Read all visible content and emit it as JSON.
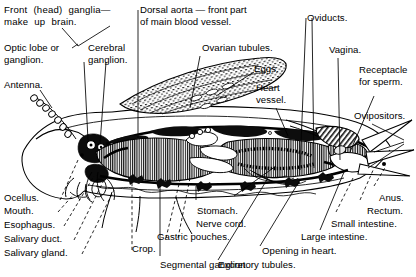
{
  "figure": {
    "orientation": "left-facing head, right-facing abdomen tip",
    "line_color": "#000000",
    "background_color": "#ffffff",
    "label_color": "#000000"
  },
  "labels": {
    "front_ganglia": "Front  (head)  ganglia—\nmake  up  brain.",
    "optic_lobe": "Optic lobe or\nganglion.",
    "cerebral_ganglion": "Cerebral\nganglion.",
    "antenna": "Antenna.",
    "dorsal_aorta": "Dorsal aorta — front part\nof main blood vessel.",
    "ovarian_tubules": "Ovarian tubules.",
    "eggs": "Eggs.",
    "heart_vessel": "Heart\nvessel.",
    "oviducts": "Oviducts.",
    "vagina": "Vagina.",
    "receptacle_for_sperm": "Receptacle\nfor sperm.",
    "ovipositors": "Ovipositors.",
    "anus": "Anus.",
    "rectum": "Rectum.",
    "small_intestine": "Small intestine.",
    "large_intestine": "Large intestine.",
    "opening_in_heart": "Opening in heart.",
    "excretory_tubules": "Excretory tubules.",
    "segmental_ganglion": "Segmental ganglion.",
    "crop": "Crop.",
    "gastric_pouches": "Gastric pouches.",
    "nerve_cord": "Nerve cord.",
    "stomach": "Stomach.",
    "salivary_gland": "Salivary gland.",
    "salivary_duct": "Salivary duct.",
    "esophagus": "Esophagus.",
    "mouth": "Mouth.",
    "ocellus": "Ocellus."
  },
  "parts": [
    {
      "id": "front_ganglia",
      "group": "nervous",
      "leader": "branched"
    },
    {
      "id": "optic_lobe",
      "group": "nervous",
      "leader": "solid"
    },
    {
      "id": "cerebral_ganglion",
      "group": "nervous",
      "leader": "solid"
    },
    {
      "id": "antenna",
      "group": "sensory",
      "leader": "solid"
    },
    {
      "id": "dorsal_aorta",
      "group": "circulatory",
      "leader": "solid"
    },
    {
      "id": "ovarian_tubules",
      "group": "reproductive",
      "leader": "solid"
    },
    {
      "id": "eggs",
      "group": "reproductive",
      "leader": "solid"
    },
    {
      "id": "heart_vessel",
      "group": "circulatory",
      "leader": "solid"
    },
    {
      "id": "oviducts",
      "group": "reproductive",
      "leader": "solid"
    },
    {
      "id": "vagina",
      "group": "reproductive",
      "leader": "solid"
    },
    {
      "id": "receptacle_for_sperm",
      "group": "reproductive",
      "leader": "solid"
    },
    {
      "id": "ovipositors",
      "group": "reproductive",
      "leader": "branched"
    },
    {
      "id": "anus",
      "group": "digestive",
      "leader": "dashed"
    },
    {
      "id": "rectum",
      "group": "digestive",
      "leader": "dashed"
    },
    {
      "id": "small_intestine",
      "group": "digestive",
      "leader": "dashed"
    },
    {
      "id": "large_intestine",
      "group": "digestive",
      "leader": "dashed"
    },
    {
      "id": "opening_in_heart",
      "group": "circulatory",
      "leader": "solid"
    },
    {
      "id": "excretory_tubules",
      "group": "excretory",
      "leader": "solid"
    },
    {
      "id": "segmental_ganglion",
      "group": "nervous",
      "leader": "solid"
    },
    {
      "id": "crop",
      "group": "digestive",
      "leader": "dashed"
    },
    {
      "id": "gastric_pouches",
      "group": "digestive",
      "leader": "dashed"
    },
    {
      "id": "nerve_cord",
      "group": "nervous",
      "leader": "solid"
    },
    {
      "id": "stomach",
      "group": "digestive",
      "leader": "solid"
    },
    {
      "id": "salivary_gland",
      "group": "digestive",
      "leader": "dashed"
    },
    {
      "id": "salivary_duct",
      "group": "digestive",
      "leader": "dashed"
    },
    {
      "id": "esophagus",
      "group": "digestive",
      "leader": "dashed"
    },
    {
      "id": "mouth",
      "group": "digestive",
      "leader": "dashed"
    },
    {
      "id": "ocellus",
      "group": "sensory",
      "leader": "solid"
    }
  ]
}
